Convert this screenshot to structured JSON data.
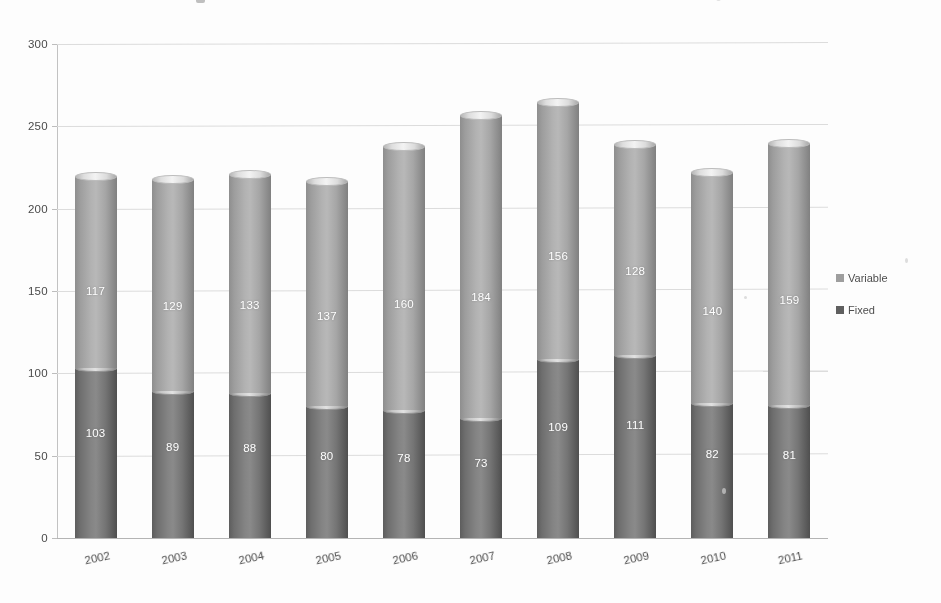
{
  "chart_data": {
    "type": "bar",
    "subtype": "stacked-cylinder",
    "title": "",
    "xlabel": "",
    "ylabel": "",
    "ylim": [
      0,
      300
    ],
    "ytick_step": 50,
    "yticks": [
      "0",
      "50",
      "100",
      "150",
      "200",
      "250",
      "300"
    ],
    "grid": true,
    "legend_position": "right",
    "categories": [
      "2002",
      "2003",
      "2004",
      "2005",
      "2006",
      "2007",
      "2008",
      "2009",
      "2010",
      "2011"
    ],
    "series": [
      {
        "name": "Variable",
        "color": "#a8a8a8",
        "values": [
          117,
          129,
          133,
          137,
          160,
          184,
          156,
          128,
          140,
          159
        ]
      },
      {
        "name": "Fixed",
        "color": "#5f5f5f",
        "values": [
          103,
          89,
          88,
          80,
          78,
          73,
          109,
          111,
          82,
          81
        ]
      }
    ],
    "totals": [
      220,
      218,
      221,
      217,
      238,
      257,
      265,
      239,
      222,
      240
    ]
  },
  "legend": {
    "items": [
      {
        "label": "Variable",
        "marker": "square-light"
      },
      {
        "label": "Fixed",
        "marker": "square-dark"
      }
    ]
  },
  "colors": {
    "variable": "#a8a8a8",
    "fixed": "#5f5f5f",
    "gridline": "#dcdcdc",
    "axis": "#c2c2c2",
    "label_text": "#4a4a4a",
    "value_text": "#ffffff",
    "background": "#fdfdfd"
  }
}
